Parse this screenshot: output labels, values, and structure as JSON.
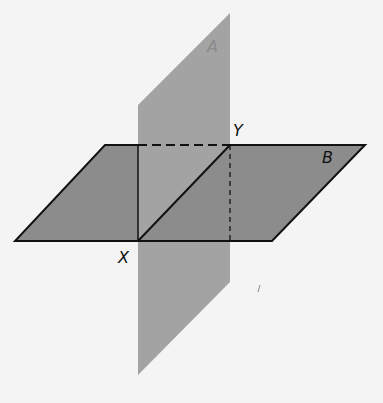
{
  "diagram": {
    "planes": [
      {
        "name": "A",
        "label": "A",
        "orientation": "vertical",
        "color": "#a3a3a3"
      },
      {
        "name": "B",
        "label": "B",
        "orientation": "horizontal",
        "color": "#8c8c8c"
      }
    ],
    "points": [
      {
        "label": "X"
      },
      {
        "label": "Y"
      }
    ],
    "intersection_line": "XY",
    "colors": {
      "background": "#f4f4f4",
      "plane_a": "#a3a3a3",
      "plane_b": "#8c8c8c",
      "edge": "#111111"
    }
  }
}
